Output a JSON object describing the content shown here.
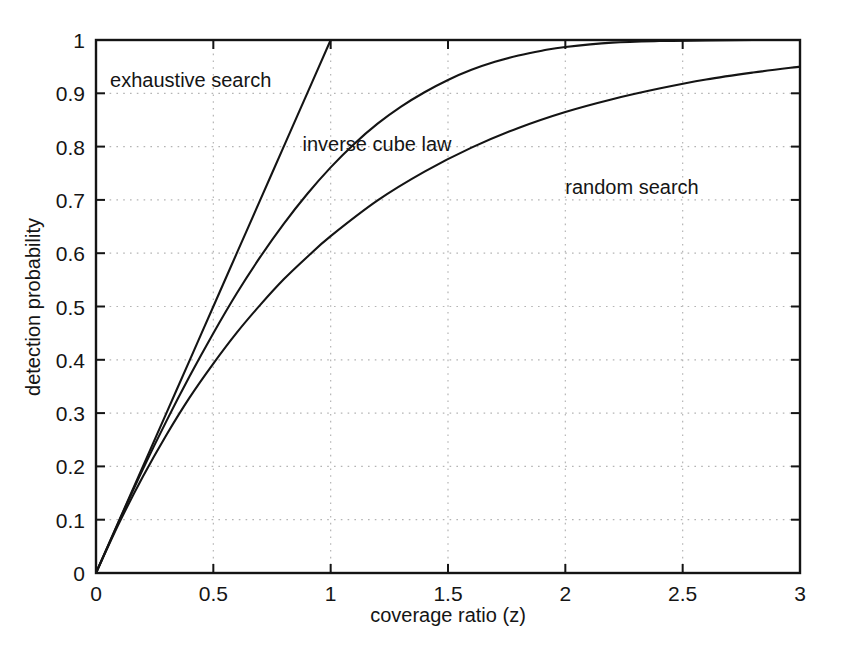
{
  "chart_data": {
    "type": "line",
    "title": "",
    "xlabel": "coverage ratio (z)",
    "ylabel": "detection probability",
    "xlim": [
      0,
      3
    ],
    "ylim": [
      0,
      1
    ],
    "grid": true,
    "grid_style": "dotted",
    "legend_position": "inline-annotations",
    "xticks": [
      "0",
      "0.5",
      "1",
      "1.5",
      "2",
      "2.5",
      "3"
    ],
    "xtick_values": [
      0,
      0.5,
      1,
      1.5,
      2,
      2.5,
      3
    ],
    "yticks": [
      "0",
      "0.1",
      "0.2",
      "0.3",
      "0.4",
      "0.5",
      "0.6",
      "0.7",
      "0.8",
      "0.9",
      "1"
    ],
    "ytick_values": [
      0,
      0.1,
      0.2,
      0.3,
      0.4,
      0.5,
      0.6,
      0.7,
      0.8,
      0.9,
      1
    ],
    "series": [
      {
        "name": "exhaustive search",
        "label": "exhaustive search",
        "color": "#141414",
        "x": [
          0,
          0.1,
          0.2,
          0.3,
          0.4,
          0.5,
          0.6,
          0.7,
          0.8,
          0.9,
          1.0
        ],
        "values": [
          0,
          0.1,
          0.2,
          0.3,
          0.4,
          0.5,
          0.6,
          0.7,
          0.8,
          0.9,
          1.0
        ]
      },
      {
        "name": "inverse cube law",
        "label": "inverse cube law",
        "color": "#141414",
        "x": [
          0,
          0.1,
          0.2,
          0.3,
          0.4,
          0.5,
          0.6,
          0.7,
          0.8,
          0.9,
          1.0,
          1.1,
          1.2,
          1.3,
          1.4,
          1.5,
          1.6,
          1.7,
          1.8,
          1.9,
          2.0,
          2.2,
          2.4,
          2.6,
          2.8,
          3.0
        ],
        "values": [
          0,
          0.099,
          0.195,
          0.285,
          0.37,
          0.45,
          0.525,
          0.593,
          0.655,
          0.711,
          0.761,
          0.805,
          0.843,
          0.875,
          0.902,
          0.925,
          0.944,
          0.959,
          0.971,
          0.98,
          0.987,
          0.995,
          0.998,
          0.999,
          1.0,
          1.0
        ]
      },
      {
        "name": "random search",
        "label": "random search",
        "color": "#141414",
        "x": [
          0,
          0.1,
          0.2,
          0.3,
          0.4,
          0.5,
          0.6,
          0.7,
          0.8,
          0.9,
          1.0,
          1.2,
          1.4,
          1.6,
          1.8,
          2.0,
          2.2,
          2.4,
          2.6,
          2.8,
          3.0
        ],
        "values": [
          0,
          0.095,
          0.181,
          0.259,
          0.33,
          0.393,
          0.451,
          0.503,
          0.551,
          0.593,
          0.632,
          0.699,
          0.753,
          0.798,
          0.835,
          0.865,
          0.889,
          0.909,
          0.926,
          0.939,
          0.95
        ]
      }
    ],
    "annotations": [
      {
        "text": "exhaustive search",
        "x": 0.06,
        "y": 0.925
      },
      {
        "text": "inverse cube law",
        "x": 0.88,
        "y": 0.805
      },
      {
        "text": "random search",
        "x": 2.0,
        "y": 0.725
      }
    ]
  },
  "axes": {
    "x_title": "coverage ratio (z)",
    "y_title": "detection probability"
  }
}
